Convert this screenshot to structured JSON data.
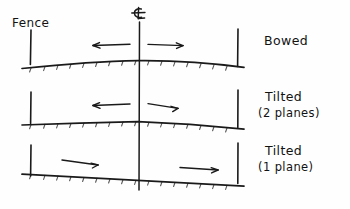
{
  "diagram": {
    "title_hidden": "",
    "labels": {
      "fence": "Fence",
      "centerline_symbol": "℄"
    },
    "rows": [
      {
        "id": "bowed",
        "label": "Bowed",
        "sublabel": "",
        "profile": "bowed-upward",
        "arrows": [
          {
            "name": "left-arrow",
            "direction": "left"
          },
          {
            "name": "right-arrow",
            "direction": "right"
          }
        ]
      },
      {
        "id": "tilted-two-planes",
        "label": "Tilted",
        "sublabel": "(2 planes)",
        "profile": "two-planes-peak",
        "arrows": [
          {
            "name": "left-arrow",
            "direction": "left"
          },
          {
            "name": "right-arrow",
            "direction": "right"
          }
        ]
      },
      {
        "id": "tilted-one-plane",
        "label": "Tilted",
        "sublabel": "(1 plane)",
        "profile": "single-plane-slope",
        "arrows": [
          {
            "name": "left-arrow",
            "direction": "right"
          },
          {
            "name": "right-arrow",
            "direction": "right"
          }
        ]
      }
    ],
    "colors": {
      "ink": "#1a1a1a",
      "paper": "#fefefe"
    }
  }
}
